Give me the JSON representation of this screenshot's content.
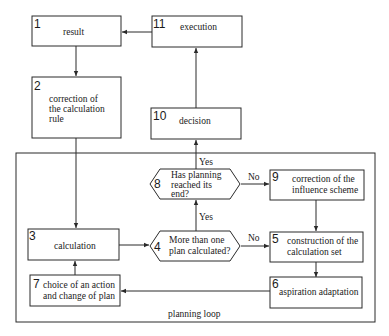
{
  "diagram": {
    "nodes": [
      {
        "id": "1",
        "number": "1",
        "label_lines": [
          "result"
        ],
        "shape": "rect"
      },
      {
        "id": "2",
        "number": "2",
        "label_lines": [
          "correction of",
          "the calculation",
          "rule"
        ],
        "shape": "rect"
      },
      {
        "id": "3",
        "number": "3",
        "label_lines": [
          "calculation"
        ],
        "shape": "rect"
      },
      {
        "id": "4",
        "number": "4",
        "label_lines": [
          "More than one",
          "plan calculated?"
        ],
        "shape": "hexagon"
      },
      {
        "id": "5",
        "number": "5",
        "label_lines": [
          "construction of the",
          "calculation set"
        ],
        "shape": "rect"
      },
      {
        "id": "6",
        "number": "6",
        "label_lines": [
          "aspiration adaptation"
        ],
        "shape": "rect"
      },
      {
        "id": "7",
        "number": "7",
        "label_lines": [
          "choice of an action",
          "and change of plan"
        ],
        "shape": "rect"
      },
      {
        "id": "8",
        "number": "8",
        "label_lines": [
          "Has planning",
          "reached its",
          "end?"
        ],
        "shape": "hexagon"
      },
      {
        "id": "9",
        "number": "9",
        "label_lines": [
          "correction of the",
          "influence scheme"
        ],
        "shape": "rect"
      },
      {
        "id": "10",
        "number": "10",
        "label_lines": [
          "decision"
        ],
        "shape": "rect"
      },
      {
        "id": "11",
        "number": "11",
        "label_lines": [
          "execution"
        ],
        "shape": "rect"
      }
    ],
    "edges": [
      {
        "from": "11",
        "to": "1",
        "label": ""
      },
      {
        "from": "1",
        "to": "2",
        "label": ""
      },
      {
        "from": "2",
        "to": "3",
        "label": ""
      },
      {
        "from": "3",
        "to": "4",
        "label": ""
      },
      {
        "from": "4",
        "to": "8",
        "label": "Yes"
      },
      {
        "from": "4",
        "to": "5",
        "label": "No"
      },
      {
        "from": "8",
        "to": "10",
        "label": "Yes"
      },
      {
        "from": "8",
        "to": "9",
        "label": "No"
      },
      {
        "from": "9",
        "to": "5",
        "label": ""
      },
      {
        "from": "5",
        "to": "6",
        "label": ""
      },
      {
        "from": "6",
        "to": "7",
        "label": ""
      },
      {
        "from": "7",
        "to": "3",
        "label": ""
      },
      {
        "from": "10",
        "to": "11",
        "label": ""
      }
    ],
    "edge_labels": {
      "yes_8_10": "Yes",
      "no_8_9": "No",
      "yes_4_8": "Yes",
      "no_4_5": "No"
    },
    "group": {
      "label": "planning loop"
    }
  }
}
